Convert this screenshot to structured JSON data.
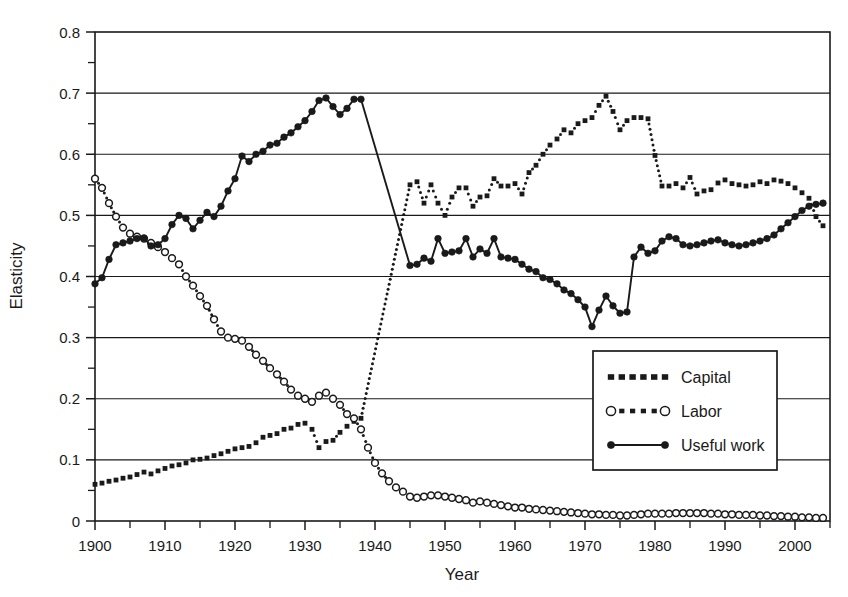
{
  "chart_data": {
    "type": "line",
    "title": "",
    "xlabel": "Year",
    "ylabel": "Elasticity",
    "xlim": [
      1900,
      2005
    ],
    "ylim": [
      0,
      0.8
    ],
    "xticks": [
      1900,
      1910,
      1920,
      1930,
      1940,
      1950,
      1960,
      1970,
      1980,
      1990,
      2000
    ],
    "xtick_labels": [
      "1900",
      "1910",
      "1920",
      "1930",
      "1940",
      "1950",
      "1960",
      "1970",
      "1980",
      "1990",
      "2000"
    ],
    "xtick_minor_step": 5,
    "yticks": [
      0,
      0.1,
      0.2,
      0.3,
      0.4,
      0.5,
      0.6,
      0.7,
      0.8
    ],
    "ytick_labels": [
      "0",
      "0.1",
      "0.2",
      "0.3",
      "0.4",
      "0.5",
      "0.6",
      "0.7",
      "0.8"
    ],
    "ytick_minor_step": 0.05,
    "grid": "horizontal",
    "legend_position": "lower-right-inset",
    "legend_entries": [
      "Capital",
      "Labor",
      "Useful work"
    ],
    "series": [
      {
        "name": "Capital",
        "marker": "filled-square",
        "linestyle": "dotted",
        "color": "#1a1a1a",
        "x": [
          1900,
          1901,
          1902,
          1903,
          1904,
          1905,
          1906,
          1907,
          1908,
          1909,
          1910,
          1911,
          1912,
          1913,
          1914,
          1915,
          1916,
          1917,
          1918,
          1919,
          1920,
          1921,
          1922,
          1923,
          1924,
          1925,
          1926,
          1927,
          1928,
          1929,
          1930,
          1931,
          1932,
          1933,
          1934,
          1935,
          1936,
          1937,
          1938,
          1945,
          1946,
          1947,
          1948,
          1949,
          1950,
          1951,
          1952,
          1953,
          1954,
          1955,
          1956,
          1957,
          1958,
          1959,
          1960,
          1961,
          1962,
          1963,
          1964,
          1965,
          1966,
          1967,
          1968,
          1969,
          1970,
          1971,
          1972,
          1973,
          1974,
          1975,
          1976,
          1977,
          1978,
          1979,
          1980,
          1981,
          1982,
          1983,
          1984,
          1985,
          1986,
          1987,
          1988,
          1989,
          1990,
          1991,
          1992,
          1993,
          1994,
          1995,
          1996,
          1997,
          1998,
          1999,
          2000,
          2001,
          2002,
          2003,
          2004
        ],
        "y": [
          0.06,
          0.062,
          0.065,
          0.067,
          0.07,
          0.072,
          0.076,
          0.08,
          0.077,
          0.082,
          0.086,
          0.09,
          0.092,
          0.095,
          0.1,
          0.101,
          0.103,
          0.107,
          0.11,
          0.114,
          0.118,
          0.12,
          0.122,
          0.128,
          0.137,
          0.14,
          0.143,
          0.15,
          0.152,
          0.158,
          0.16,
          0.15,
          0.12,
          0.13,
          0.132,
          0.145,
          0.155,
          0.163,
          0.168,
          0.55,
          0.555,
          0.52,
          0.55,
          0.52,
          0.5,
          0.53,
          0.545,
          0.545,
          0.515,
          0.53,
          0.532,
          0.56,
          0.548,
          0.548,
          0.552,
          0.535,
          0.57,
          0.582,
          0.6,
          0.615,
          0.625,
          0.64,
          0.635,
          0.65,
          0.655,
          0.66,
          0.68,
          0.695,
          0.67,
          0.64,
          0.655,
          0.66,
          0.66,
          0.658,
          0.598,
          0.548,
          0.548,
          0.552,
          0.545,
          0.562,
          0.535,
          0.54,
          0.542,
          0.553,
          0.558,
          0.552,
          0.55,
          0.548,
          0.55,
          0.555,
          0.552,
          0.558,
          0.556,
          0.552,
          0.545,
          0.537,
          0.528,
          0.498,
          0.483
        ]
      },
      {
        "name": "Labor",
        "marker": "open-circle",
        "linestyle": "dotted",
        "color": "#1a1a1a",
        "x": [
          1900,
          1901,
          1902,
          1903,
          1904,
          1905,
          1906,
          1907,
          1908,
          1909,
          1910,
          1911,
          1912,
          1913,
          1914,
          1915,
          1916,
          1917,
          1918,
          1919,
          1920,
          1921,
          1922,
          1923,
          1924,
          1925,
          1926,
          1927,
          1928,
          1929,
          1930,
          1931,
          1932,
          1933,
          1934,
          1935,
          1936,
          1937,
          1938,
          1939,
          1940,
          1941,
          1942,
          1943,
          1944,
          1945,
          1946,
          1947,
          1948,
          1949,
          1950,
          1951,
          1952,
          1953,
          1954,
          1955,
          1956,
          1957,
          1958,
          1959,
          1960,
          1961,
          1962,
          1963,
          1964,
          1965,
          1966,
          1967,
          1968,
          1969,
          1970,
          1971,
          1972,
          1973,
          1974,
          1975,
          1976,
          1977,
          1978,
          1979,
          1980,
          1981,
          1982,
          1983,
          1984,
          1985,
          1986,
          1987,
          1988,
          1989,
          1990,
          1991,
          1992,
          1993,
          1994,
          1995,
          1996,
          1997,
          1998,
          1999,
          2000,
          2001,
          2002,
          2003,
          2004
        ],
        "y": [
          0.56,
          0.545,
          0.52,
          0.498,
          0.48,
          0.47,
          0.465,
          0.462,
          0.455,
          0.448,
          0.44,
          0.43,
          0.42,
          0.4,
          0.385,
          0.368,
          0.352,
          0.33,
          0.31,
          0.3,
          0.298,
          0.295,
          0.285,
          0.272,
          0.262,
          0.25,
          0.24,
          0.228,
          0.215,
          0.205,
          0.2,
          0.195,
          0.205,
          0.21,
          0.2,
          0.19,
          0.175,
          0.168,
          0.15,
          0.12,
          0.095,
          0.078,
          0.065,
          0.055,
          0.048,
          0.04,
          0.038,
          0.04,
          0.042,
          0.042,
          0.04,
          0.038,
          0.036,
          0.034,
          0.03,
          0.032,
          0.03,
          0.028,
          0.026,
          0.024,
          0.022,
          0.022,
          0.02,
          0.019,
          0.018,
          0.017,
          0.016,
          0.015,
          0.014,
          0.013,
          0.012,
          0.011,
          0.011,
          0.01,
          0.01,
          0.009,
          0.009,
          0.01,
          0.011,
          0.012,
          0.012,
          0.012,
          0.012,
          0.013,
          0.013,
          0.013,
          0.013,
          0.013,
          0.012,
          0.012,
          0.011,
          0.011,
          0.01,
          0.01,
          0.01,
          0.009,
          0.009,
          0.008,
          0.008,
          0.007,
          0.007,
          0.006,
          0.006,
          0.005,
          0.005
        ]
      },
      {
        "name": "Useful work",
        "marker": "filled-circle",
        "linestyle": "solid",
        "color": "#1a1a1a",
        "x": [
          1900,
          1901,
          1902,
          1903,
          1904,
          1905,
          1906,
          1907,
          1908,
          1909,
          1910,
          1911,
          1912,
          1913,
          1914,
          1915,
          1916,
          1917,
          1918,
          1919,
          1920,
          1921,
          1922,
          1923,
          1924,
          1925,
          1926,
          1927,
          1928,
          1929,
          1930,
          1931,
          1932,
          1933,
          1934,
          1935,
          1936,
          1937,
          1938,
          1945,
          1946,
          1947,
          1948,
          1949,
          1950,
          1951,
          1952,
          1953,
          1954,
          1955,
          1956,
          1957,
          1958,
          1959,
          1960,
          1961,
          1962,
          1963,
          1964,
          1965,
          1966,
          1967,
          1968,
          1969,
          1970,
          1971,
          1972,
          1973,
          1974,
          1975,
          1976,
          1977,
          1978,
          1979,
          1980,
          1981,
          1982,
          1983,
          1984,
          1985,
          1986,
          1987,
          1988,
          1989,
          1990,
          1991,
          1992,
          1993,
          1994,
          1995,
          1996,
          1997,
          1998,
          1999,
          2000,
          2001,
          2002,
          2003,
          2004
        ],
        "y": [
          0.388,
          0.398,
          0.428,
          0.452,
          0.455,
          0.458,
          0.462,
          0.463,
          0.45,
          0.452,
          0.462,
          0.485,
          0.5,
          0.495,
          0.478,
          0.492,
          0.505,
          0.498,
          0.515,
          0.54,
          0.56,
          0.597,
          0.588,
          0.6,
          0.605,
          0.615,
          0.618,
          0.628,
          0.635,
          0.645,
          0.655,
          0.67,
          0.688,
          0.692,
          0.678,
          0.665,
          0.675,
          0.69,
          0.69,
          0.418,
          0.42,
          0.43,
          0.425,
          0.462,
          0.438,
          0.44,
          0.442,
          0.462,
          0.432,
          0.445,
          0.438,
          0.462,
          0.432,
          0.43,
          0.428,
          0.42,
          0.412,
          0.408,
          0.398,
          0.395,
          0.388,
          0.378,
          0.372,
          0.362,
          0.35,
          0.318,
          0.345,
          0.368,
          0.352,
          0.34,
          0.342,
          0.432,
          0.448,
          0.438,
          0.442,
          0.458,
          0.465,
          0.462,
          0.452,
          0.45,
          0.452,
          0.455,
          0.458,
          0.46,
          0.455,
          0.452,
          0.45,
          0.452,
          0.455,
          0.458,
          0.462,
          0.468,
          0.478,
          0.488,
          0.498,
          0.508,
          0.515,
          0.518,
          0.52
        ]
      }
    ]
  }
}
